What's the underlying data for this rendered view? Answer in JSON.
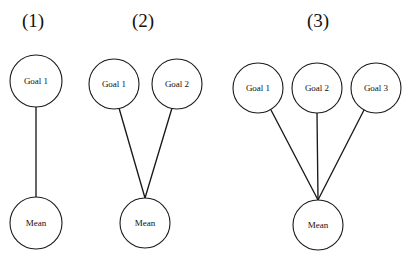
{
  "figure": {
    "type": "path-diagram",
    "background_color": "#ffffff",
    "stroke_color": "#1a1a1a",
    "text_color": "#111111",
    "node_shape": "circle"
  },
  "panels": [
    {
      "label": "(1)",
      "label_x": 33,
      "label_y": 23,
      "goal_count": 1,
      "nodes": [
        {
          "name": "goal-1",
          "label": "Goal 1",
          "cx": 36,
          "cy": 81,
          "r": 26
        },
        {
          "name": "mean",
          "label": "Mean",
          "cx": 36,
          "cy": 223,
          "r": 26
        }
      ],
      "edges": [
        {
          "from": "goal-1",
          "to": "mean",
          "x1": 36,
          "y1": 107,
          "x2": 36,
          "y2": 197
        }
      ]
    },
    {
      "label": "(2)",
      "label_x": 143,
      "label_y": 23,
      "goal_count": 2,
      "nodes": [
        {
          "name": "goal-1",
          "label": "Goal 1",
          "cx": 114,
          "cy": 84,
          "r": 25
        },
        {
          "name": "goal-2",
          "label": "Goal 2",
          "cx": 177,
          "cy": 84,
          "r": 25
        },
        {
          "name": "mean",
          "label": "Mean",
          "cx": 145,
          "cy": 223,
          "r": 25
        }
      ],
      "edges": [
        {
          "from": "goal-1",
          "to": "mean",
          "x1": 119,
          "y1": 108,
          "x2": 145,
          "y2": 198
        },
        {
          "from": "goal-2",
          "to": "mean",
          "x1": 172,
          "y1": 108,
          "x2": 145,
          "y2": 198
        }
      ]
    },
    {
      "label": "(3)",
      "label_x": 318,
      "label_y": 23,
      "goal_count": 3,
      "nodes": [
        {
          "name": "goal-1",
          "label": "Goal 1",
          "cx": 258,
          "cy": 88,
          "r": 25
        },
        {
          "name": "goal-2",
          "label": "Goal 2",
          "cx": 317,
          "cy": 88,
          "r": 25
        },
        {
          "name": "goal-3",
          "label": "Goal 3",
          "cx": 376,
          "cy": 88,
          "r": 25
        },
        {
          "name": "mean",
          "label": "Mean",
          "cx": 318,
          "cy": 225,
          "r": 25
        }
      ],
      "edges": [
        {
          "from": "goal-1",
          "to": "mean",
          "x1": 271,
          "y1": 110,
          "x2": 318,
          "y2": 200
        },
        {
          "from": "goal-2",
          "to": "mean",
          "x1": 317,
          "y1": 113,
          "x2": 318,
          "y2": 200
        },
        {
          "from": "goal-3",
          "to": "mean",
          "x1": 364,
          "y1": 110,
          "x2": 318,
          "y2": 200
        }
      ]
    }
  ]
}
